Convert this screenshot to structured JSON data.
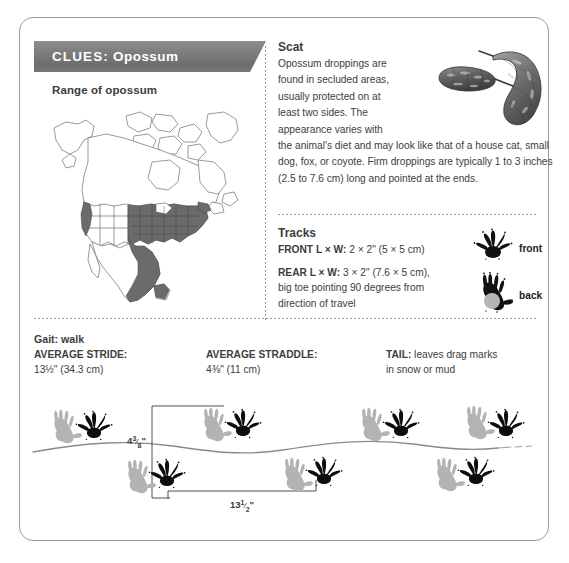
{
  "card": {
    "banner": {
      "keyword": "CLUES:",
      "subject": "Opossum",
      "full_label": "CLUES: Opossum"
    },
    "range": {
      "title": "Range of opossum",
      "map_name": "north-america-range-map",
      "shaded_region_color": "#6b6b6b",
      "outline_color": "#6e6e6e"
    },
    "scat": {
      "heading": "Scat",
      "narrow_paragraph": "Opossum droppings are found in secluded areas, usually protected on at least two sides. The appearance varies with",
      "wide_paragraph": "the animal's diet and may look like that of a house cat, small dog, fox, or coyote. Firm droppings are typically 1 to 3 inches (2.5 to 7.6 cm) long and pointed at the ends.",
      "image_name": "scat-illustration"
    },
    "tracks": {
      "heading": "Tracks",
      "front_label_bold": "FRONT L × W:",
      "front_value": " 2 × 2\" (5 × 5 cm)",
      "rear_label_bold": "REAR L × W:",
      "rear_value": " 3 × 2\" (7.6 × 5 cm),",
      "rear_note_line1": "big toe pointing 90 degrees from",
      "rear_note_line2": "direction of travel",
      "front_print_caption": "front",
      "back_print_caption": "back"
    },
    "gait": {
      "title": "Gait: walk",
      "columns": [
        {
          "label": "AVERAGE STRIDE:",
          "value": "13½\" (34.3 cm)"
        },
        {
          "label": "AVERAGE STRADDLE:",
          "value": "4⅜\" (11 cm)"
        },
        {
          "label": "TAIL:",
          "value": " leaves drag marks",
          "value_line2": "in snow or mud"
        }
      ],
      "diagram": {
        "straddle_label": "4⅜\"",
        "stride_label": "13½\"",
        "front_print_color": "#0d0d0d",
        "rear_print_color": "#b3b3b3",
        "tail_drag_color": "#8a8a8a"
      }
    }
  },
  "colors": {
    "banner_gray": "#7d7d7d",
    "text": "#3d3d3d",
    "border": "#9a9a9a",
    "dotted": "#9b9b9b"
  }
}
